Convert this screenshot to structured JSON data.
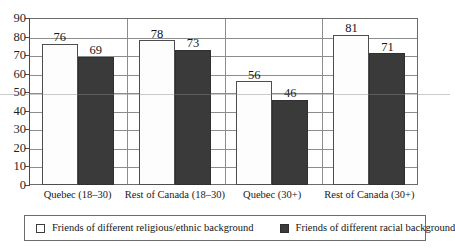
{
  "chart_data": {
    "type": "bar",
    "title": "",
    "xlabel": "",
    "ylabel": "",
    "ylim": [
      0,
      90
    ],
    "ytick_step": 10,
    "yticks": [
      0,
      10,
      20,
      30,
      40,
      50,
      60,
      70,
      80,
      90
    ],
    "grid": true,
    "legend_position": "bottom",
    "categories": [
      "Quebec (18–30)",
      "Rest of Canada (18–30)",
      "Quebec (30+)",
      "Rest of Canada (30+)"
    ],
    "series": [
      {
        "name": "Friends of different religious/ethnic background",
        "color": "#ffffff",
        "values": [
          76,
          78,
          56,
          81
        ]
      },
      {
        "name": "Friends of different racial background",
        "color": "#3a3a3a",
        "values": [
          69,
          73,
          46,
          71
        ]
      }
    ]
  },
  "axis": {
    "y_tick_labels": [
      "0",
      "10",
      "20",
      "30",
      "40",
      "50",
      "60",
      "70",
      "80",
      "90"
    ]
  },
  "legend": {
    "items": [
      {
        "label": "Friends of different religious/ethnic background",
        "swatch": "light-square-icon"
      },
      {
        "label": "Friends of different racial background",
        "swatch": "dark-square-icon"
      }
    ]
  }
}
